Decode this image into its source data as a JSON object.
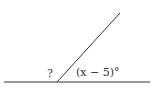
{
  "diagram": {
    "type": "angle-diagram",
    "labels": {
      "unknown_angle": "?",
      "known_angle": "(x − 5)°"
    },
    "geometry": {
      "line": {
        "x1": 4,
        "y1": 82,
        "x2": 150,
        "y2": 82
      },
      "ray": {
        "x1": 57,
        "y1": 82,
        "x2": 120,
        "y2": 13
      },
      "vertex": {
        "x": 57,
        "y": 82
      }
    },
    "colors": {
      "stroke": "#333333",
      "background": "#ffffff"
    }
  }
}
